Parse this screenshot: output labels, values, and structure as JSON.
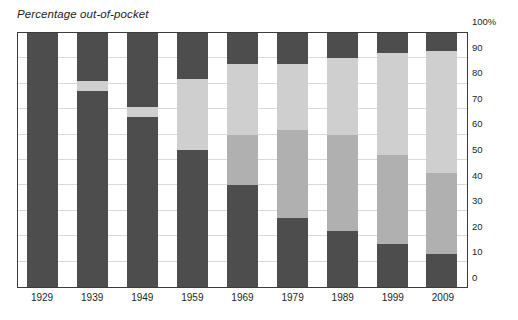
{
  "chart_data": {
    "type": "bar",
    "stacked": true,
    "title": "Percentage out-of-pocket",
    "xlabel": "",
    "ylabel": "",
    "ylim": [
      0,
      100
    ],
    "grid": true,
    "legend": "none",
    "categories": [
      "1929",
      "1939",
      "1949",
      "1959",
      "1969",
      "1979",
      "1989",
      "1999",
      "2009"
    ],
    "y_ticks": [
      "0",
      "10",
      "20",
      "30",
      "40",
      "50",
      "60",
      "70",
      "80",
      "90",
      "100%"
    ],
    "y_tick_values": [
      0,
      10,
      20,
      30,
      40,
      50,
      60,
      70,
      80,
      90,
      100
    ],
    "colors": {
      "dark": "#4d4d4d",
      "medium": "#b0b0b0",
      "light": "#cfcfcf",
      "axis": "#3b3b3b",
      "grid": "#d9d9d9",
      "text": "#231f20"
    },
    "series": [
      {
        "name": "out-of-pocket",
        "color_key": "dark",
        "values": [
          100,
          77,
          67,
          54,
          40,
          27,
          22,
          17,
          13
        ]
      },
      {
        "name": "segment-2",
        "color_key": "medium",
        "values": [
          0,
          0,
          0,
          0,
          20,
          35,
          38,
          35,
          32
        ]
      },
      {
        "name": "segment-3",
        "color_key": "light",
        "values": [
          0,
          4,
          4,
          28,
          28,
          26,
          30,
          40,
          48
        ]
      },
      {
        "name": "segment-4",
        "color_key": "dark",
        "values": [
          0,
          19,
          29,
          18,
          12,
          12,
          10,
          8,
          7
        ]
      }
    ],
    "bars": [
      {
        "year": "1929",
        "segments": [
          {
            "from": 0,
            "to": 100,
            "color_key": "dark"
          }
        ]
      },
      {
        "year": "1939",
        "segments": [
          {
            "from": 0,
            "to": 77,
            "color_key": "dark"
          },
          {
            "from": 77,
            "to": 81,
            "color_key": "light"
          },
          {
            "from": 81,
            "to": 100,
            "color_key": "dark"
          }
        ]
      },
      {
        "year": "1949",
        "segments": [
          {
            "from": 0,
            "to": 67,
            "color_key": "dark"
          },
          {
            "from": 67,
            "to": 71,
            "color_key": "light"
          },
          {
            "from": 71,
            "to": 100,
            "color_key": "dark"
          }
        ]
      },
      {
        "year": "1959",
        "segments": [
          {
            "from": 0,
            "to": 54,
            "color_key": "dark"
          },
          {
            "from": 54,
            "to": 82,
            "color_key": "light"
          },
          {
            "from": 82,
            "to": 100,
            "color_key": "dark"
          }
        ]
      },
      {
        "year": "1969",
        "segments": [
          {
            "from": 0,
            "to": 40,
            "color_key": "dark"
          },
          {
            "from": 40,
            "to": 60,
            "color_key": "medium"
          },
          {
            "from": 60,
            "to": 88,
            "color_key": "light"
          },
          {
            "from": 88,
            "to": 100,
            "color_key": "dark"
          }
        ]
      },
      {
        "year": "1979",
        "segments": [
          {
            "from": 0,
            "to": 27,
            "color_key": "dark"
          },
          {
            "from": 27,
            "to": 62,
            "color_key": "medium"
          },
          {
            "from": 62,
            "to": 88,
            "color_key": "light"
          },
          {
            "from": 88,
            "to": 100,
            "color_key": "dark"
          }
        ]
      },
      {
        "year": "1989",
        "segments": [
          {
            "from": 0,
            "to": 22,
            "color_key": "dark"
          },
          {
            "from": 22,
            "to": 60,
            "color_key": "medium"
          },
          {
            "from": 60,
            "to": 90,
            "color_key": "light"
          },
          {
            "from": 90,
            "to": 100,
            "color_key": "dark"
          }
        ]
      },
      {
        "year": "1999",
        "segments": [
          {
            "from": 0,
            "to": 17,
            "color_key": "dark"
          },
          {
            "from": 17,
            "to": 52,
            "color_key": "medium"
          },
          {
            "from": 52,
            "to": 92,
            "color_key": "light"
          },
          {
            "from": 92,
            "to": 100,
            "color_key": "dark"
          }
        ]
      },
      {
        "year": "2009",
        "segments": [
          {
            "from": 0,
            "to": 13,
            "color_key": "dark"
          },
          {
            "from": 13,
            "to": 45,
            "color_key": "medium"
          },
          {
            "from": 45,
            "to": 93,
            "color_key": "light"
          },
          {
            "from": 93,
            "to": 100,
            "color_key": "dark"
          }
        ]
      }
    ]
  }
}
